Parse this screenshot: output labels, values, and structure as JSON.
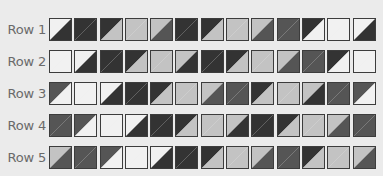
{
  "palette": {
    "L": "#f1f1f1",
    "G": "#c3c3c3",
    "M": "#555555",
    "D": "#333333"
  },
  "rows": [
    {
      "label": "Row 1",
      "cells": [
        [
          "L",
          "D"
        ],
        [
          "D",
          "D"
        ],
        [
          "D",
          "G"
        ],
        [
          "G",
          "G"
        ],
        [
          "G",
          "M"
        ],
        [
          "D",
          "D"
        ],
        [
          "D",
          "G"
        ],
        [
          "G",
          "G"
        ],
        [
          "G",
          "M"
        ],
        [
          "M",
          "M"
        ],
        [
          "D",
          "L"
        ],
        [
          "L",
          "L"
        ],
        [
          "L",
          "D"
        ]
      ]
    },
    {
      "label": "Row 2",
      "cells": [
        [
          "L",
          "L"
        ],
        [
          "L",
          "D"
        ],
        [
          "D",
          "D"
        ],
        [
          "D",
          "G"
        ],
        [
          "G",
          "G"
        ],
        [
          "G",
          "D"
        ],
        [
          "D",
          "D"
        ],
        [
          "D",
          "G"
        ],
        [
          "G",
          "G"
        ],
        [
          "G",
          "M"
        ],
        [
          "M",
          "M"
        ],
        [
          "D",
          "L"
        ],
        [
          "L",
          "L"
        ]
      ]
    },
    {
      "label": "Row 3",
      "cells": [
        [
          "M",
          "L"
        ],
        [
          "L",
          "L"
        ],
        [
          "L",
          "D"
        ],
        [
          "D",
          "D"
        ],
        [
          "D",
          "G"
        ],
        [
          "G",
          "G"
        ],
        [
          "G",
          "M"
        ],
        [
          "M",
          "M"
        ],
        [
          "D",
          "G"
        ],
        [
          "G",
          "G"
        ],
        [
          "G",
          "D"
        ],
        [
          "M",
          "M"
        ],
        [
          "M",
          "L"
        ]
      ]
    },
    {
      "label": "Row 4",
      "cells": [
        [
          "M",
          "M"
        ],
        [
          "M",
          "L"
        ],
        [
          "L",
          "L"
        ],
        [
          "L",
          "D"
        ],
        [
          "D",
          "D"
        ],
        [
          "D",
          "G"
        ],
        [
          "G",
          "G"
        ],
        [
          "G",
          "D"
        ],
        [
          "D",
          "D"
        ],
        [
          "D",
          "G"
        ],
        [
          "G",
          "G"
        ],
        [
          "G",
          "M"
        ],
        [
          "M",
          "M"
        ]
      ]
    },
    {
      "label": "Row 5",
      "cells": [
        [
          "G",
          "M"
        ],
        [
          "M",
          "M"
        ],
        [
          "M",
          "L"
        ],
        [
          "L",
          "L"
        ],
        [
          "L",
          "D"
        ],
        [
          "D",
          "D"
        ],
        [
          "D",
          "G"
        ],
        [
          "G",
          "G"
        ],
        [
          "G",
          "M"
        ],
        [
          "M",
          "M"
        ],
        [
          "D",
          "G"
        ],
        [
          "G",
          "G"
        ],
        [
          "G",
          "M"
        ]
      ]
    }
  ]
}
